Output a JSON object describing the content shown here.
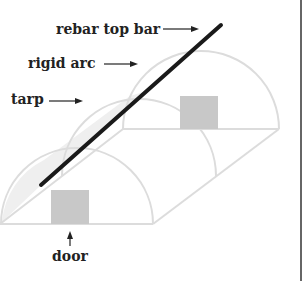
{
  "diagram": {
    "labels": {
      "rebar": "rebar top bar",
      "arc": "rigid arc",
      "tarp": "tarp",
      "door": "door"
    },
    "colors": {
      "structure": "#dedede",
      "tarp_fill": "#eeeeee",
      "door_fill": "#c8c8c8",
      "rebar": "#1a1a1a",
      "text": "#222222",
      "border": "#333333"
    }
  }
}
